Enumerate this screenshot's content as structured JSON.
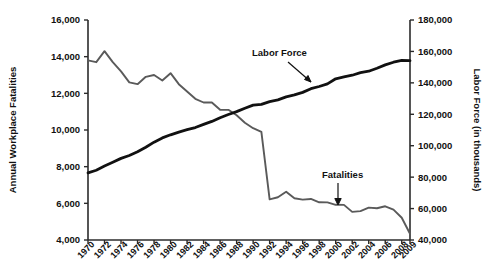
{
  "chart_data": {
    "type": "line",
    "title": "",
    "subtitle": "",
    "xlabel": "",
    "ylabel": "Annual Workplace Fatalities",
    "y2label": "Labor Force (in thousands)",
    "grid": false,
    "legend_position": "inline-annotations",
    "ylim": [
      4000,
      16000
    ],
    "y2lim": [
      40000,
      180000
    ],
    "ytick_labels": [
      "4,000",
      "6,000",
      "8,000",
      "10,000",
      "12,000",
      "14,000",
      "16,000"
    ],
    "ytick_values": [
      4000,
      6000,
      8000,
      10000,
      12000,
      14000,
      16000
    ],
    "y2tick_labels": [
      "40,000",
      "60,000",
      "80,000",
      "100,000",
      "120,000",
      "140,000",
      "160,000",
      "180,000"
    ],
    "y2tick_values": [
      40000,
      60000,
      80000,
      100000,
      120000,
      140000,
      160000,
      180000
    ],
    "xtick_labels": [
      "1970",
      "1972",
      "1974",
      "1976",
      "1978",
      "1980",
      "1982",
      "1984",
      "1986",
      "1988",
      "1990",
      "1992",
      "1994",
      "1996",
      "1998",
      "2000",
      "2002",
      "2004",
      "2006",
      "2008",
      "2009"
    ],
    "x": [
      1970,
      1971,
      1972,
      1973,
      1974,
      1975,
      1976,
      1977,
      1978,
      1979,
      1980,
      1981,
      1982,
      1983,
      1984,
      1985,
      1986,
      1987,
      1988,
      1989,
      1990,
      1991,
      1992,
      1993,
      1994,
      1995,
      1996,
      1997,
      1998,
      1999,
      2000,
      2001,
      2002,
      2003,
      2004,
      2005,
      2006,
      2007,
      2008,
      2009
    ],
    "series": [
      {
        "name": "Fatalities",
        "axis": "left",
        "color": "#5a5a5a",
        "units": "annual workplace fatalities",
        "values": [
          13800,
          13700,
          14300,
          13700,
          13200,
          12600,
          12500,
          12900,
          13000,
          12700,
          13100,
          12500,
          12100,
          11700,
          11500,
          11500,
          11100,
          11100,
          10800,
          10400,
          10100,
          9900,
          6217,
          6331,
          6632,
          6275,
          6202,
          6238,
          6055,
          6054,
          5920,
          5915,
          5534,
          5575,
          5764,
          5734,
          5840,
          5657,
          5214,
          4340
        ]
      },
      {
        "name": "Labor Force",
        "axis": "right",
        "color": "#111111",
        "units": "thousands of workers",
        "values": [
          82771,
          84382,
          87034,
          89429,
          91949,
          93775,
          96158,
          99009,
          102251,
          104962,
          106940,
          108670,
          110204,
          111550,
          113544,
          115461,
          117834,
          119865,
          121669,
          123869,
          125840,
          126346,
          128105,
          129200,
          131056,
          132304,
          133943,
          136297,
          137673,
          139368,
          142583,
          143734,
          144863,
          146510,
          147401,
          149320,
          151428,
          153124,
          154287,
          154142
        ]
      }
    ],
    "annotations": [
      {
        "text": "Labor Force",
        "target_series": "Labor Force",
        "arrow": "down-right"
      },
      {
        "text": "Fatalities",
        "target_series": "Fatalities",
        "arrow": "down"
      }
    ]
  }
}
